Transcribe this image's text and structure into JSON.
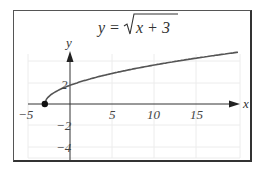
{
  "chart_data": {
    "type": "line",
    "title_parts": {
      "lhs": "y =",
      "radicand": "x + 3"
    },
    "xlabel": "x",
    "ylabel": "y",
    "xlim": [
      -5,
      20
    ],
    "ylim": [
      -5,
      5
    ],
    "x_ticks": [
      {
        "value": -5,
        "label": "−5"
      },
      {
        "value": 5,
        "label": "5"
      },
      {
        "value": 10,
        "label": "10"
      },
      {
        "value": 15,
        "label": "15"
      }
    ],
    "y_ticks": [
      {
        "value": 2,
        "label": "2"
      },
      {
        "value": -2,
        "label": "−2"
      },
      {
        "value": -4,
        "label": "−4"
      }
    ],
    "grid": true,
    "series": [
      {
        "name": "y = sqrt(x + 3)",
        "x": [
          -3,
          -2,
          -1,
          0,
          1,
          2,
          4,
          6,
          9,
          13,
          17,
          20
        ],
        "y": [
          0,
          1,
          1.414,
          1.732,
          2,
          2.236,
          2.646,
          3,
          3.464,
          4,
          4.472,
          4.796
        ]
      }
    ],
    "annotations": [
      {
        "type": "point",
        "x": -3,
        "y": 0,
        "style": "filled-dot",
        "label": "starting point (-3, 0)"
      }
    ],
    "colors": {
      "curve": "#555555",
      "axes": "#333333",
      "grid": "#eeeeee",
      "frame": "#444444"
    }
  }
}
